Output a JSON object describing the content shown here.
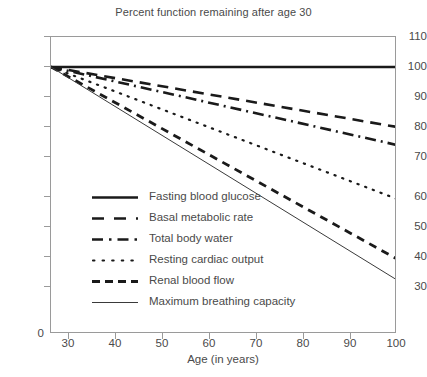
{
  "chart_data": {
    "type": "line",
    "title": "Percent function remaining after age 30",
    "xlabel": "Age (in years)",
    "ylabel": "",
    "xlim": [
      30,
      100
    ],
    "ylim": [
      25,
      110
    ],
    "xticks": [
      30,
      40,
      50,
      60,
      70,
      80,
      90,
      100
    ],
    "yticks": [
      30,
      40,
      50,
      60,
      70,
      80,
      90,
      100,
      110
    ],
    "x_origin_label": "0",
    "y_origin_label": "0",
    "grid": false,
    "legend_position": "inside-lower-left",
    "x": [
      30,
      100
    ],
    "series": [
      {
        "name": "Fasting blood glucose",
        "values": [
          100,
          100
        ],
        "style": "solid-thick",
        "color": "#1a1a1a"
      },
      {
        "name": "Basal metabolic rate",
        "values": [
          100,
          80
        ],
        "style": "long-dash",
        "color": "#1a1a1a"
      },
      {
        "name": "Total body water",
        "values": [
          100,
          74
        ],
        "style": "dash-dot",
        "color": "#1a1a1a"
      },
      {
        "name": "Resting cardiac output",
        "values": [
          100,
          56
        ],
        "style": "dotted",
        "color": "#1a1a1a"
      },
      {
        "name": "Renal blood flow",
        "values": [
          100,
          36
        ],
        "style": "medium-dash",
        "color": "#1a1a1a"
      },
      {
        "name": "Maximum breathing capacity",
        "values": [
          100,
          29
        ],
        "style": "solid-thin",
        "color": "#3a3a3a"
      }
    ]
  },
  "axes": {
    "y_tick_labels": [
      "110",
      "100",
      "90",
      "80",
      "70",
      "60",
      "50",
      "40",
      "30"
    ],
    "x_tick_labels": [
      "30",
      "40",
      "50",
      "60",
      "70",
      "80",
      "90",
      "100"
    ],
    "zero_label": "0",
    "x_axis_title": "Age (in years)"
  },
  "legend": {
    "items": [
      {
        "label": "Fasting blood glucose"
      },
      {
        "label": "Basal metabolic rate"
      },
      {
        "label": "Total body water"
      },
      {
        "label": "Resting cardiac output"
      },
      {
        "label": "Renal blood flow"
      },
      {
        "label": "Maximum breathing capacity"
      }
    ]
  },
  "colors": {
    "line": "#1a1a1a",
    "thin_line": "#3a3a3a",
    "axis": "#9a9a9a",
    "text": "#4a4a4a",
    "background": "#ffffff"
  }
}
